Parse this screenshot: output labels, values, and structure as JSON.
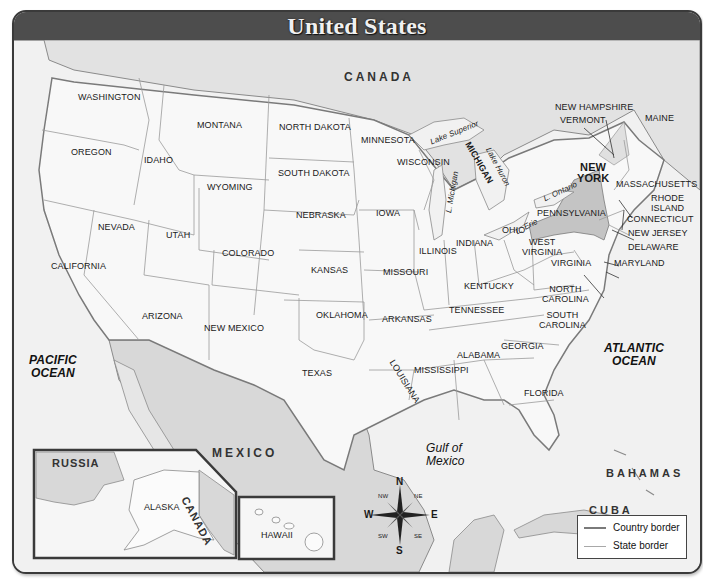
{
  "title": "United States",
  "countries": {
    "canada_top": "CANADA",
    "mexico": "MEXICO",
    "russia": "RUSSIA",
    "canada_inset": "CANADA",
    "bahamas": "BAHAMAS",
    "cuba": "CUBA"
  },
  "oceans": {
    "pacific_line1": "PACIFIC",
    "pacific_line2": "OCEAN",
    "atlantic_line1": "ATLANTIC",
    "atlantic_line2": "OCEAN",
    "gulf_line1": "Gulf of",
    "gulf_line2": "Mexico"
  },
  "lakes": {
    "superior": "Lake Superior",
    "michigan": "L. Michigan",
    "huron": "Lake Huron",
    "ontario": "L. Ontario",
    "erie": "L. Erie"
  },
  "states": {
    "washington": "WASHINGTON",
    "oregon": "OREGON",
    "california": "CALIFORNIA",
    "nevada": "NEVADA",
    "idaho": "IDAHO",
    "montana": "MONTANA",
    "wyoming": "WYOMING",
    "utah": "UTAH",
    "arizona": "ARIZONA",
    "colorado": "COLORADO",
    "new_mexico": "NEW MEXICO",
    "north_dakota": "NORTH DAKOTA",
    "south_dakota": "SOUTH DAKOTA",
    "nebraska": "NEBRASKA",
    "kansas": "KANSAS",
    "oklahoma": "OKLAHOMA",
    "texas": "TEXAS",
    "minnesota": "MINNESOTA",
    "iowa": "IOWA",
    "missouri": "MISSOURI",
    "arkansas": "ARKANSAS",
    "louisiana": "LOUISIANA",
    "wisconsin": "WISCONSIN",
    "michigan": "MICHIGAN",
    "illinois": "ILLINOIS",
    "indiana": "INDIANA",
    "ohio": "OHIO",
    "kentucky": "KENTUCKY",
    "tennessee": "TENNESSEE",
    "mississippi": "MISSISSIPPI",
    "alabama": "ALABAMA",
    "georgia": "GEORGIA",
    "florida": "FLORIDA",
    "south_carolina_1": "SOUTH",
    "south_carolina_2": "CAROLINA",
    "north_carolina_1": "NORTH",
    "north_carolina_2": "CAROLINA",
    "virginia": "VIRGINIA",
    "west_virginia_1": "WEST",
    "west_virginia_2": "VIRGINIA",
    "pennsylvania": "PENNSYLVANIA",
    "new_york_1": "NEW",
    "new_york_2": "YORK",
    "vermont": "VERMONT",
    "new_hampshire": "NEW HAMPSHIRE",
    "maine": "MAINE",
    "massachusetts": "MASSACHUSETTS",
    "rhode_island_1": "RHODE",
    "rhode_island_2": "ISLAND",
    "connecticut": "CONNECTICUT",
    "new_jersey": "NEW JERSEY",
    "delaware": "DELAWARE",
    "maryland": "MARYLAND",
    "alaska": "ALASKA",
    "hawaii": "HAWAII"
  },
  "compass": {
    "n": "N",
    "s": "S",
    "e": "E",
    "w": "W",
    "ne": "NE",
    "nw": "NW",
    "se": "SE",
    "sw": "SW"
  },
  "legend": {
    "country_border": "Country  border",
    "state_border": "State border"
  },
  "colors": {
    "title_bar": "#4d4d4d",
    "land_us": "#f7f7f7",
    "foreign_land": "#d8d8d8",
    "highlight_state": "#c4c4c4",
    "water": "#efefef",
    "country_border": "#7a7a7a",
    "state_border": "#9a9a9a"
  }
}
